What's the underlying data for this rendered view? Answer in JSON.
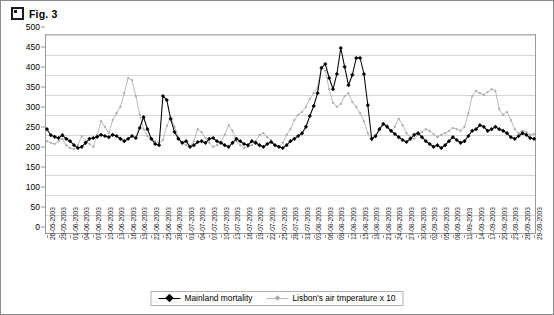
{
  "header": {
    "title": "Fig. 3",
    "icon": "square-bullet-icon"
  },
  "legend": {
    "position": "bottom-center",
    "items": [
      {
        "label": "Mainland mortality",
        "color": "#000000",
        "marker": "filled-diamond"
      },
      {
        "label": "Lisbon's air tmperature x 10",
        "color": "#a8a8a8",
        "marker": "small-diamond"
      }
    ]
  },
  "chart_data": {
    "type": "line",
    "title": "Fig. 3",
    "xlabel": "",
    "ylabel": "",
    "ylim": [
      0,
      500
    ],
    "ytick_step": 50,
    "yticks": [
      0,
      50,
      100,
      150,
      200,
      250,
      300,
      350,
      400,
      450,
      500
    ],
    "grid": true,
    "xlabel_rotation": -90,
    "xtick_label_interval": 3,
    "x_tick_labels": [
      "26-05-2003",
      "29-05-2003",
      "01-06-2003",
      "04-06-2003",
      "07-06-2003",
      "10-06-2003",
      "13-06-2003",
      "16-06-2003",
      "19-06-2003",
      "22-06-2003",
      "25-06-2003",
      "28-06-2003",
      "01-07-2003",
      "04-07-2003",
      "07-07-2003",
      "10-07-2003",
      "13-07-2003",
      "16-07-2003",
      "19-07-2003",
      "22-07-2003",
      "25-07-2003",
      "28-07-2003",
      "31-07-2003",
      "03-08-2003",
      "06-08-2003",
      "09-08-2003",
      "12-08-2003",
      "15-08-2003",
      "18-08-2003",
      "21-08-2003",
      "24-08-2003",
      "27-08-2003",
      "30-08-2003",
      "02-09-2003",
      "05-09-2003",
      "08-09-2003",
      "11-09-2003",
      "14-09-2003",
      "17-09-2003",
      "20-09-2003",
      "23-09-2003",
      "26-09-2003",
      "29-09-2003"
    ],
    "x": [
      "26-05-2003",
      "27-05-2003",
      "28-05-2003",
      "29-05-2003",
      "30-05-2003",
      "31-05-2003",
      "01-06-2003",
      "02-06-2003",
      "03-06-2003",
      "04-06-2003",
      "05-06-2003",
      "06-06-2003",
      "07-06-2003",
      "08-06-2003",
      "09-06-2003",
      "10-06-2003",
      "11-06-2003",
      "12-06-2003",
      "13-06-2003",
      "14-06-2003",
      "15-06-2003",
      "16-06-2003",
      "17-06-2003",
      "18-06-2003",
      "19-06-2003",
      "20-06-2003",
      "21-06-2003",
      "22-06-2003",
      "23-06-2003",
      "24-06-2003",
      "25-06-2003",
      "26-06-2003",
      "27-06-2003",
      "28-06-2003",
      "29-06-2003",
      "30-06-2003",
      "01-07-2003",
      "02-07-2003",
      "03-07-2003",
      "04-07-2003",
      "05-07-2003",
      "06-07-2003",
      "07-07-2003",
      "08-07-2003",
      "09-07-2003",
      "10-07-2003",
      "11-07-2003",
      "12-07-2003",
      "13-07-2003",
      "14-07-2003",
      "15-07-2003",
      "16-07-2003",
      "17-07-2003",
      "18-07-2003",
      "19-07-2003",
      "20-07-2003",
      "21-07-2003",
      "22-07-2003",
      "23-07-2003",
      "24-07-2003",
      "25-07-2003",
      "26-07-2003",
      "27-07-2003",
      "28-07-2003",
      "29-07-2003",
      "30-07-2003",
      "31-07-2003",
      "01-08-2003",
      "02-08-2003",
      "03-08-2003",
      "04-08-2003",
      "05-08-2003",
      "06-08-2003",
      "07-08-2003",
      "08-08-2003",
      "09-08-2003",
      "10-08-2003",
      "11-08-2003",
      "12-08-2003",
      "13-08-2003",
      "14-08-2003",
      "15-08-2003",
      "16-08-2003",
      "17-08-2003",
      "18-08-2003",
      "19-08-2003",
      "20-08-2003",
      "21-08-2003",
      "22-08-2003",
      "23-08-2003",
      "24-08-2003",
      "25-08-2003",
      "26-08-2003",
      "27-08-2003",
      "28-08-2003",
      "29-08-2003",
      "30-08-2003",
      "31-08-2003",
      "01-09-2003",
      "02-09-2003",
      "03-09-2003",
      "04-09-2003",
      "05-09-2003",
      "06-09-2003",
      "07-09-2003",
      "08-09-2003",
      "09-09-2003",
      "10-09-2003",
      "11-09-2003",
      "12-09-2003",
      "13-09-2003",
      "14-09-2003",
      "15-09-2003",
      "16-09-2003",
      "17-09-2003",
      "18-09-2003",
      "19-09-2003",
      "20-09-2003",
      "21-09-2003",
      "22-09-2003",
      "23-09-2003",
      "24-09-2003",
      "25-09-2003",
      "26-09-2003",
      "27-09-2003",
      "28-09-2003",
      "29-09-2003"
    ],
    "series": [
      {
        "name": "Mainland mortality",
        "color": "#000000",
        "marker": "filled-diamond",
        "values": [
          262,
          247,
          243,
          240,
          247,
          238,
          232,
          222,
          215,
          218,
          228,
          238,
          240,
          243,
          248,
          245,
          242,
          248,
          245,
          238,
          232,
          238,
          245,
          240,
          265,
          292,
          262,
          238,
          225,
          222,
          345,
          335,
          288,
          255,
          238,
          228,
          232,
          218,
          222,
          230,
          232,
          228,
          238,
          240,
          232,
          228,
          222,
          218,
          228,
          238,
          232,
          225,
          222,
          232,
          228,
          222,
          218,
          225,
          230,
          222,
          218,
          215,
          222,
          232,
          238,
          245,
          252,
          268,
          295,
          320,
          352,
          415,
          425,
          390,
          362,
          400,
          465,
          418,
          372,
          398,
          440,
          440,
          400,
          322,
          238,
          245,
          262,
          275,
          268,
          258,
          250,
          242,
          235,
          230,
          238,
          248,
          252,
          242,
          232,
          225,
          218,
          222,
          215,
          222,
          232,
          242,
          235,
          228,
          232,
          245,
          258,
          262,
          272,
          268,
          258,
          262,
          268,
          262,
          258,
          252,
          242,
          238,
          245,
          252,
          248,
          240,
          238
        ]
      },
      {
        "name": "Lisbon's air tmperature x 10",
        "color": "#a8a8a8",
        "marker": "small-diamond",
        "values": [
          232,
          228,
          225,
          232,
          238,
          222,
          215,
          212,
          222,
          245,
          232,
          225,
          218,
          248,
          282,
          268,
          252,
          285,
          302,
          318,
          352,
          390,
          385,
          345,
          298,
          262,
          245,
          238,
          232,
          228,
          235,
          270,
          292,
          268,
          242,
          228,
          222,
          218,
          232,
          262,
          255,
          240,
          228,
          218,
          222,
          230,
          248,
          272,
          258,
          232,
          222,
          215,
          218,
          222,
          232,
          248,
          252,
          242,
          235,
          222,
          218,
          228,
          248,
          262,
          285,
          298,
          305,
          318,
          338,
          352,
          365,
          418,
          408,
          362,
          328,
          318,
          325,
          345,
          352,
          330,
          318,
          302,
          282,
          252,
          235,
          242,
          262,
          278,
          272,
          258,
          268,
          288,
          272,
          252,
          242,
          238,
          248,
          255,
          262,
          258,
          250,
          242,
          248,
          252,
          258,
          265,
          262,
          258,
          268,
          302,
          345,
          358,
          352,
          348,
          355,
          362,
          358,
          312,
          298,
          305,
          285,
          262,
          252,
          258,
          255,
          248,
          250
        ]
      }
    ]
  }
}
